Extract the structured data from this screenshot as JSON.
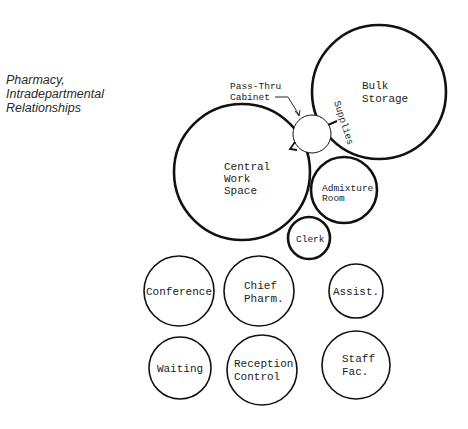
{
  "title": {
    "lines": [
      "Pharmacy,",
      "Intradepartmental",
      "Relationships"
    ]
  },
  "rooms": {
    "bulk_storage": {
      "lines": [
        "Bulk",
        "Storage"
      ]
    },
    "pass_thru_cabinet": {
      "lines": [
        "Pass-Thru",
        "Cabinet"
      ]
    },
    "central_work_space": {
      "lines": [
        "Central",
        "Work",
        "Space"
      ]
    },
    "admixture_room": {
      "lines": [
        "Admixture",
        "Room"
      ]
    },
    "clerk": {
      "lines": [
        "Clerk"
      ]
    },
    "conference": {
      "lines": [
        "Conference"
      ]
    },
    "chief_pharm": {
      "lines": [
        "Chief",
        "Pharm."
      ]
    },
    "assist": {
      "lines": [
        "Assist."
      ]
    },
    "waiting": {
      "lines": [
        "Waiting"
      ]
    },
    "reception_control": {
      "lines": [
        "Reception",
        "Control"
      ]
    },
    "staff_fac": {
      "lines": [
        "Staff",
        "Fac."
      ]
    }
  },
  "connections": {
    "supplies_label": "Supplies"
  }
}
